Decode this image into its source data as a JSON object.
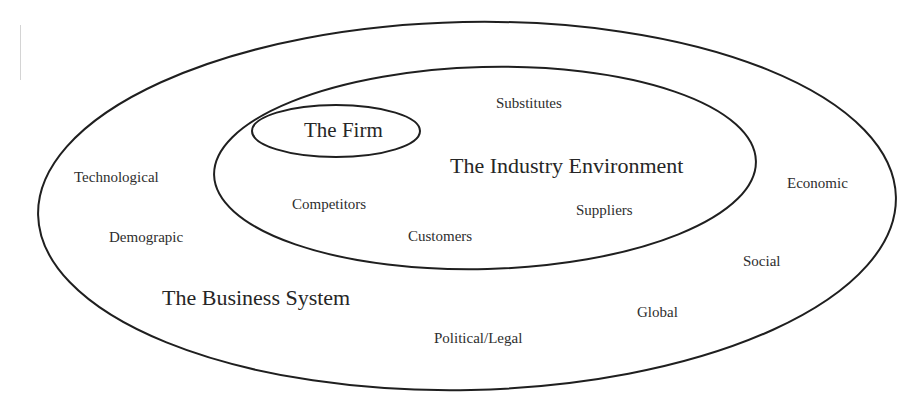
{
  "diagram": {
    "type": "nested-ellipses",
    "stroke_color": "#1a1a1a",
    "background": "#ffffff",
    "regions": {
      "outer": {
        "label": "The Business System"
      },
      "middle": {
        "label": "The Industry Environment"
      },
      "inner": {
        "label": "The Firm"
      }
    },
    "industry_forces": {
      "substitutes": "Substitutes",
      "competitors": "Competitors",
      "customers": "Customers",
      "suppliers": "Suppliers"
    },
    "macro_forces": {
      "technological": "Technological",
      "demographic": "Demograpic",
      "economic": "Economic",
      "social": "Social",
      "global": "Global",
      "political_legal": "Political/Legal"
    }
  }
}
